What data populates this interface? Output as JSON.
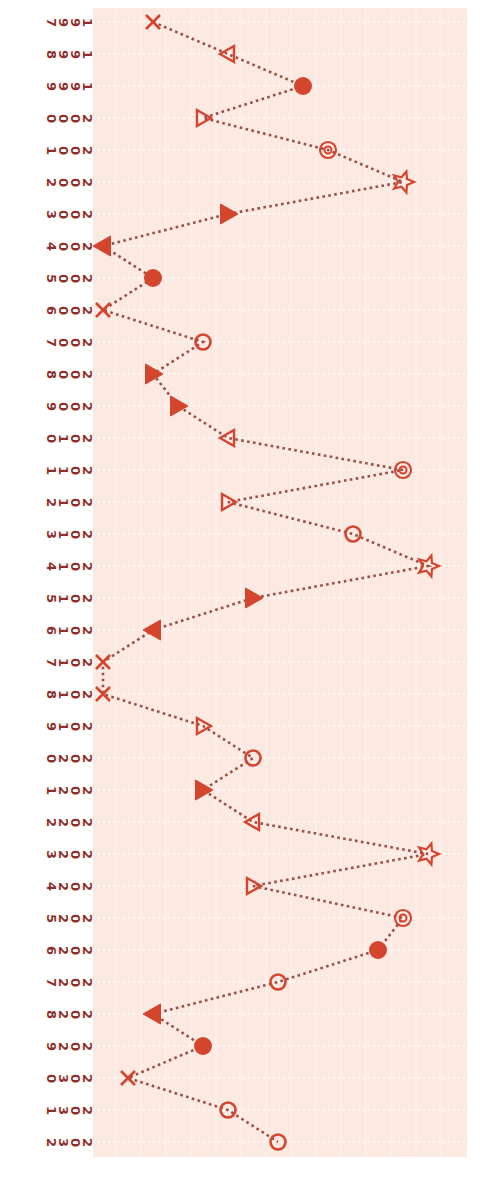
{
  "chart_data": {
    "type": "line",
    "orientation": "rotated-90-cw",
    "title": "",
    "xlabel": "",
    "ylabel": "",
    "categories": [
      "1997",
      "1998",
      "1999",
      "2000",
      "2001",
      "2002",
      "2003",
      "2004",
      "2005",
      "2006",
      "2007",
      "2008",
      "2009",
      "2010",
      "2011",
      "2012",
      "2013",
      "2014",
      "2015",
      "2016",
      "2017",
      "2018",
      "2019",
      "2020",
      "2021",
      "2022",
      "2023",
      "2024",
      "2025",
      "2026",
      "2027",
      "2028",
      "2029",
      "2030",
      "2031",
      "2032"
    ],
    "series": [
      {
        "name": "series",
        "values": [
          2,
          5,
          8,
          4,
          9,
          12,
          5,
          0,
          2,
          0,
          4,
          2,
          3,
          5,
          12,
          5,
          10,
          13,
          6,
          2,
          0,
          0,
          4,
          6,
          4,
          6,
          13,
          6,
          12,
          11,
          7,
          2,
          4,
          1,
          5,
          7
        ],
        "markers": [
          "x",
          "tri-left-open",
          "circle-filled",
          "tri-right-open",
          "double-circle",
          "star",
          "tri-right-filled",
          "tri-left-filled",
          "circle-filled",
          "x",
          "circle-open",
          "tri-right-filled",
          "tri-right-filled",
          "tri-left-open",
          "double-circle",
          "tri-right-open",
          "circle-open",
          "star",
          "tri-right-filled",
          "tri-left-filled",
          "x",
          "x",
          "tri-right-open",
          "circle-open",
          "tri-right-filled",
          "tri-left-open",
          "star",
          "tri-right-open",
          "double-circle",
          "circle-filled",
          "circle-open",
          "tri-left-filled",
          "circle-filled",
          "x",
          "circle-open",
          "circle-open"
        ],
        "line_style": "dotted"
      }
    ],
    "value_range": [
      0,
      14
    ],
    "grid": true,
    "legend": "none",
    "colors": {
      "marker": "#d4452e",
      "line": "#9a4f48",
      "label": "#8f2f2a",
      "plot_background": "#fbe9e2",
      "grid": "#ffffff"
    }
  }
}
